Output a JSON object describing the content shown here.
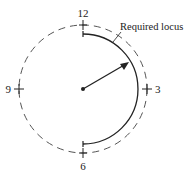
{
  "diagram": {
    "type": "clock-locus",
    "center": {
      "x": 83,
      "y": 89
    },
    "outer_circle": {
      "radius": 64,
      "style": "dashed"
    },
    "locus_arc": {
      "radius": 55,
      "from": "12",
      "to": "6",
      "side": "right",
      "style": "solid"
    },
    "hand": {
      "from": "center",
      "to": {
        "x": 128,
        "y": 63
      }
    },
    "labels": {
      "twelve": "12",
      "three": "3",
      "six": "6",
      "nine": "9",
      "locus": "Required locus"
    },
    "colors": {
      "line": "#222222",
      "dashed": "#555555",
      "background": "#ffffff"
    }
  }
}
